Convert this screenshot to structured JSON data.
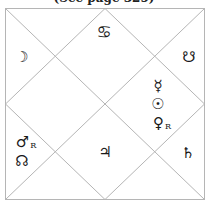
{
  "caption": "(See page 325)",
  "chart": {
    "style": "North Indian",
    "line_color": "#b5b5b5",
    "ascendant_sign": {
      "name": "Cancer",
      "glyph": "♋"
    },
    "houses": [
      {
        "house": 1,
        "sign": "Cancer",
        "items": [
          {
            "name": "cancer-sign",
            "glyph": "♋"
          }
        ]
      },
      {
        "house": 2,
        "items": [
          {
            "name": "moon",
            "glyph": "☽"
          }
        ]
      },
      {
        "house": 12,
        "items": [
          {
            "name": "south-node",
            "glyph": "☋"
          }
        ]
      },
      {
        "house": 11,
        "items": [
          {
            "name": "mercury",
            "glyph": "☿"
          },
          {
            "name": "sun",
            "glyph": "☉"
          },
          {
            "name": "venus",
            "glyph": "♀",
            "retrograde": "R"
          }
        ]
      },
      {
        "house": 4,
        "items": [
          {
            "name": "mars",
            "glyph": "♂",
            "retrograde": "R"
          },
          {
            "name": "north-node",
            "glyph": "☊"
          }
        ]
      },
      {
        "house": 7,
        "items": [
          {
            "name": "jupiter",
            "glyph": "♃"
          }
        ]
      },
      {
        "house": 9,
        "items": [
          {
            "name": "saturn",
            "glyph": "♄"
          }
        ]
      }
    ]
  },
  "glyphs": {
    "cancer": "♋",
    "moon": "☽",
    "south_node": "☋",
    "mercury": "☿",
    "sun": "☉",
    "venus": "♀",
    "mars": "♂",
    "north_node": "☊",
    "jupiter": "♃",
    "saturn": "♄",
    "retrograde": "R"
  }
}
